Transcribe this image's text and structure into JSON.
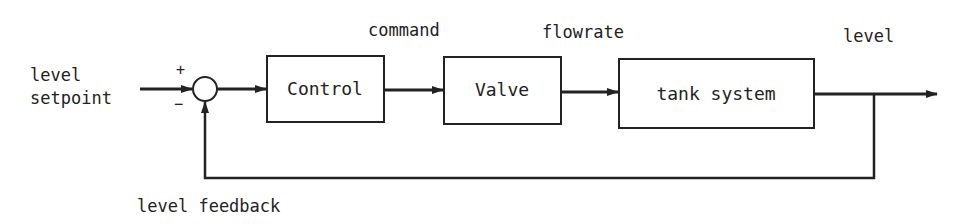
{
  "diagram": {
    "type": "feedback-control-block-diagram",
    "input": {
      "line1": "level",
      "line2": "setpoint"
    },
    "summing_junction": {
      "plus": "+",
      "minus": "−"
    },
    "blocks": [
      {
        "id": "control",
        "label": "Control"
      },
      {
        "id": "valve",
        "label": "Valve"
      },
      {
        "id": "tank",
        "label": "tank system"
      }
    ],
    "signals": {
      "command": "command",
      "flowrate": "flowrate",
      "output": "level",
      "feedback": "level feedback"
    },
    "colors": {
      "stroke": "#222222",
      "background": "#ffffff"
    }
  }
}
